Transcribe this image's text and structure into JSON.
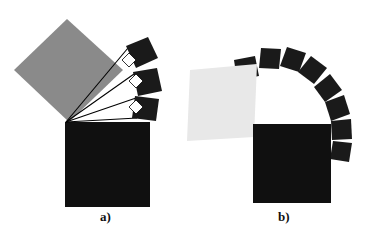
{
  "figure": {
    "title": "",
    "background_color": "#ffffff",
    "width": 369,
    "height": 238,
    "panels": [
      {
        "id": "a",
        "caption": "a)",
        "caption_x": 100,
        "caption_y": 210,
        "description": "Large medium-gray square hinged at a pivot with three progressively rotated black squares and right-angle markers, sitting on a large black square",
        "shapes": {
          "big_black_square": {
            "name": "base-square",
            "color": "#101010",
            "points": "65,122 150,122 150,207 65,207"
          },
          "gray_square": {
            "name": "rotating-gray-square",
            "color": "#8a8a8a",
            "points": "67,19 123,70 69,122 14,70"
          },
          "rotated_squares": [
            {
              "name": "rotated-square-1",
              "color": "#1a1a1a",
              "points": "126,46 148,37 158,58 136,68"
            },
            {
              "name": "rotated-square-2",
              "color": "#1a1a1a",
              "points": "133,72 157,68 162,91 138,96"
            },
            {
              "name": "rotated-square-3",
              "color": "#1a1a1a",
              "points": "135,96 159,99 156,121 132,118"
            }
          ],
          "pivot": {
            "name": "pivot-point",
            "x": 66,
            "y": 122
          },
          "rays": [
            {
              "name": "ray-1",
              "x1": 66,
              "y1": 122,
              "x2": 128,
              "y2": 48
            },
            {
              "name": "ray-2",
              "x1": 66,
              "y1": 122,
              "x2": 134,
              "y2": 74
            },
            {
              "name": "ray-3",
              "x1": 66,
              "y1": 122,
              "x2": 136,
              "y2": 98
            },
            {
              "name": "ray-4",
              "x1": 66,
              "y1": 122,
              "x2": 137,
              "y2": 118
            }
          ],
          "right_angle_markers": [
            {
              "name": "right-angle-marker-1",
              "points": "122,60 129,53 136,60 129,67"
            },
            {
              "name": "right-angle-marker-2",
              "points": "129,81 136,74 143,81 136,88"
            },
            {
              "name": "right-angle-marker-3",
              "points": "129,107 136,100 143,107 136,114"
            }
          ]
        }
      },
      {
        "id": "b",
        "caption": "b)",
        "caption_x": 278,
        "caption_y": 210,
        "description": "Light-gray square at left, black base square at right, with an arc of eight small black squares sweeping overhead",
        "shapes": {
          "big_black_square": {
            "name": "base-square",
            "color": "#101010",
            "points": "253,124 331,124 331,203 253,203"
          },
          "light_gray_square": {
            "name": "light-gray-square",
            "color": "#e8e8e8",
            "points": "190,70 257,64 254,137 187,141"
          },
          "arc_squares_count": 8,
          "arc_squares": [
            {
              "name": "arc-square-1",
              "color": "#1a1a1a",
              "points": "234,60 255,56 259,76 237,80"
            },
            {
              "name": "arc-square-2",
              "color": "#1a1a1a",
              "points": "261,48 281,49 279,69 259,68"
            },
            {
              "name": "arc-square-3",
              "color": "#1a1a1a",
              "points": "287,47 306,53 299,72 280,66"
            },
            {
              "name": "arc-square-4",
              "color": "#1a1a1a",
              "points": "311,56 327,68 314,84 298,72"
            },
            {
              "name": "arc-square-5",
              "color": "#1a1a1a",
              "points": "330,74 342,90 325,102 314,87"
            },
            {
              "name": "arc-square-6",
              "color": "#1a1a1a",
              "points": "344,95 350,114 331,121 325,102"
            },
            {
              "name": "arc-square-7",
              "color": "#1a1a1a",
              "points": "351,119 352,139 332,140 331,121"
            },
            {
              "name": "arc-square-8",
              "color": "#1a1a1a",
              "points": "352,143 349,162 330,159 333,141"
            }
          ]
        }
      }
    ]
  },
  "colors": {
    "black": "#101010",
    "dark": "#1a1a1a",
    "mid_gray": "#8a8a8a",
    "light_gray": "#e8e8e8",
    "white": "#ffffff",
    "line": "#000000"
  }
}
